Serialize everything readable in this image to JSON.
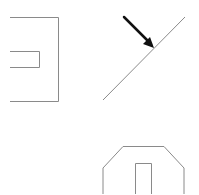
{
  "canvas": {
    "width": 199,
    "height": 194,
    "background": "#ffffff"
  },
  "colors": {
    "line": "#8a8a8a",
    "arrow": "#111111"
  },
  "shapes": {
    "bracket_with_slot": {
      "label": "bracket-shape"
    },
    "diagonal_with_arrow": {
      "label": "diagonal-line-with-arrow"
    },
    "house_with_door": {
      "label": "house-outline-with-door"
    }
  }
}
